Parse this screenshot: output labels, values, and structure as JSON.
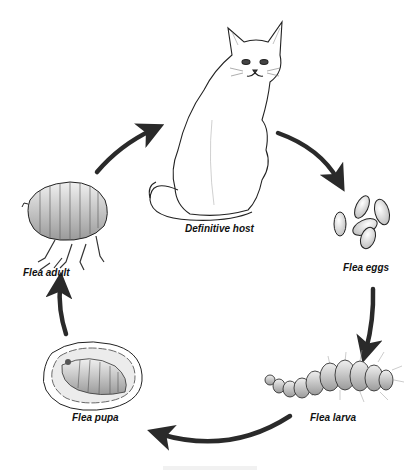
{
  "diagram": {
    "type": "cycle",
    "stages": [
      {
        "id": "host",
        "label": "Definitive host",
        "icon": "cat-icon"
      },
      {
        "id": "eggs",
        "label": "Flea eggs",
        "icon": "flea-eggs-icon"
      },
      {
        "id": "larva",
        "label": "Flea larva",
        "icon": "flea-larva-icon"
      },
      {
        "id": "pupa",
        "label": "Flea pupa",
        "icon": "flea-pupa-icon"
      },
      {
        "id": "adult",
        "label": "Flea adult",
        "icon": "flea-adult-icon"
      }
    ],
    "arrows": [
      {
        "from": "adult",
        "to": "host"
      },
      {
        "from": "host",
        "to": "eggs"
      },
      {
        "from": "eggs",
        "to": "larva"
      },
      {
        "from": "larva",
        "to": "pupa"
      },
      {
        "from": "pupa",
        "to": "adult"
      }
    ],
    "colors": {
      "arrow": "#2a2a2a",
      "outline": "#222222",
      "fill_light": "#e6e6e6",
      "fill_mid": "#bdbdbd"
    }
  }
}
